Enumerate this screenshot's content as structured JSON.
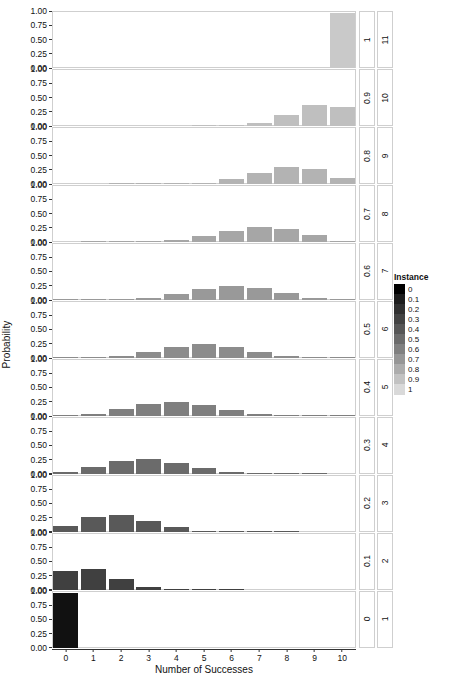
{
  "chart_data": {
    "type": "bar",
    "title": "",
    "xlabel": "Number of Successes",
    "ylabel": "Probability",
    "x": [
      0,
      1,
      2,
      3,
      4,
      5,
      6,
      7,
      8,
      9,
      10
    ],
    "xlim": [
      -0.5,
      10.5
    ],
    "ylim": [
      0,
      1
    ],
    "yticks": [
      0.0,
      0.25,
      0.5,
      0.75,
      1.0
    ],
    "ytick_labels": [
      "0.00",
      "0.25",
      "0.50",
      "0.75",
      "1.00"
    ],
    "xtick_labels": [
      "0",
      "1",
      "2",
      "3",
      "4",
      "5",
      "6",
      "7",
      "8",
      "9",
      "10"
    ],
    "grid": false,
    "legend": {
      "title": "Instance",
      "position": "right",
      "entries": [
        "0",
        "0.1",
        "0.2",
        "0.3",
        "0.4",
        "0.5",
        "0.6",
        "0.7",
        "0.8",
        "0.9",
        "1"
      ],
      "colors": [
        "#000000",
        "#1c1c1c",
        "#2f2f2f",
        "#424242",
        "#565656",
        "#6b6b6b",
        "#808080",
        "#969696",
        "#acacac",
        "#c2c2c2",
        "#d9d9d9"
      ]
    },
    "facets": [
      {
        "panel_label": "11",
        "instance_label": "1",
        "instance": 1,
        "color": "#c9c9c9",
        "values": [
          0,
          0,
          0,
          0,
          0,
          0,
          0,
          0,
          0,
          0,
          1
        ]
      },
      {
        "panel_label": "10",
        "instance_label": "0.9",
        "instance": 0.9,
        "color": "#bfbfbf",
        "values": [
          0,
          0,
          0,
          0,
          0,
          0.0001,
          0.0015,
          0.0574,
          0.1937,
          0.3874,
          0.3487
        ]
      },
      {
        "panel_label": "9",
        "instance_label": "0.8",
        "instance": 0.8,
        "color": "#b3b3b3",
        "values": [
          0,
          0,
          0.0001,
          0.0008,
          0.0055,
          0.0264,
          0.0881,
          0.2013,
          0.302,
          0.2684,
          0.1074
        ]
      },
      {
        "panel_label": "8",
        "instance_label": "0.7",
        "instance": 0.7,
        "color": "#a6a6a6",
        "values": [
          0,
          0.0001,
          0.0014,
          0.009,
          0.0368,
          0.1029,
          0.2001,
          0.2668,
          0.2335,
          0.1211,
          0.0282
        ]
      },
      {
        "panel_label": "7",
        "instance_label": "0.6",
        "instance": 0.6,
        "color": "#999999",
        "values": [
          0.0001,
          0.0016,
          0.0106,
          0.0425,
          0.1115,
          0.2007,
          0.2508,
          0.215,
          0.1209,
          0.0403,
          0.006
        ]
      },
      {
        "panel_label": "6",
        "instance_label": "0.5",
        "instance": 0.5,
        "color": "#8c8c8c",
        "values": [
          0.001,
          0.0098,
          0.0439,
          0.1172,
          0.2051,
          0.2461,
          0.2051,
          0.1172,
          0.0439,
          0.0098,
          0.001
        ]
      },
      {
        "panel_label": "5",
        "instance_label": "0.4",
        "instance": 0.4,
        "color": "#7f7f7f",
        "values": [
          0.006,
          0.0403,
          0.1209,
          0.215,
          0.2508,
          0.2007,
          0.1115,
          0.0425,
          0.0106,
          0.0016,
          0.0001
        ]
      },
      {
        "panel_label": "4",
        "instance_label": "0.3",
        "instance": 0.3,
        "color": "#6b6b6b",
        "values": [
          0.0282,
          0.1211,
          0.2335,
          0.2668,
          0.2001,
          0.1029,
          0.0368,
          0.009,
          0.0014,
          0.0001,
          0
        ]
      },
      {
        "panel_label": "3",
        "instance_label": "0.2",
        "instance": 0.2,
        "color": "#595959",
        "values": [
          0.1074,
          0.2684,
          0.302,
          0.2013,
          0.0881,
          0.0264,
          0.0055,
          0.0008,
          0.0001,
          0,
          0
        ]
      },
      {
        "panel_label": "2",
        "instance_label": "0.1",
        "instance": 0.1,
        "color": "#404040",
        "values": [
          0.3487,
          0.3874,
          0.1937,
          0.0574,
          0.0112,
          0.0015,
          0.0001,
          0,
          0,
          0,
          0
        ]
      },
      {
        "panel_label": "1",
        "instance_label": "0",
        "instance": 0,
        "color": "#111111",
        "values": [
          1,
          0,
          0,
          0,
          0,
          0,
          0,
          0,
          0,
          0,
          0
        ]
      }
    ]
  }
}
